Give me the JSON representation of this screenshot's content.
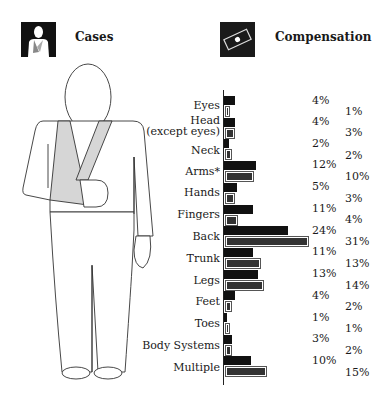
{
  "header": {
    "cases_title": "Cases",
    "compensation_title": "Compensation",
    "cases_icon": "injured-person-icon",
    "compensation_icon": "money-bill-icon"
  },
  "chart_data": {
    "type": "bar",
    "orientation": "horizontal",
    "categories": [
      "Eyes",
      "Head (except eyes)",
      "Neck",
      "Arms*",
      "Hands",
      "Fingers",
      "Back",
      "Trunk",
      "Legs",
      "Feet",
      "Toes",
      "Body Systems",
      "Multiple"
    ],
    "series": [
      {
        "name": "Cases",
        "color": "#111111",
        "values": [
          4,
          4,
          2,
          12,
          5,
          11,
          24,
          11,
          13,
          4,
          1,
          3,
          10
        ]
      },
      {
        "name": "Compensation",
        "color": "#333333",
        "values": [
          1,
          3,
          2,
          10,
          3,
          4,
          31,
          13,
          14,
          2,
          1,
          2,
          15
        ]
      }
    ],
    "value_suffix": "%",
    "grid": false,
    "legend": "icons at top: Cases (left), Compensation (right)"
  },
  "rows": [
    {
      "label": "Eyes",
      "label2": "",
      "cases": "4%",
      "comp": "1%"
    },
    {
      "label": "Head",
      "label2": "(except eyes)",
      "cases": "4%",
      "comp": "3%"
    },
    {
      "label": "Neck",
      "label2": "",
      "cases": "2%",
      "comp": "2%"
    },
    {
      "label": "Arms*",
      "label2": "",
      "cases": "12%",
      "comp": "10%"
    },
    {
      "label": "Hands",
      "label2": "",
      "cases": "5%",
      "comp": "3%"
    },
    {
      "label": "Fingers",
      "label2": "",
      "cases": "11%",
      "comp": "4%"
    },
    {
      "label": "Back",
      "label2": "",
      "cases": "24%",
      "comp": "31%"
    },
    {
      "label": "Trunk",
      "label2": "",
      "cases": "11%",
      "comp": "13%"
    },
    {
      "label": "Legs",
      "label2": "",
      "cases": "13%",
      "comp": "14%"
    },
    {
      "label": "Feet",
      "label2": "",
      "cases": "4%",
      "comp": "2%"
    },
    {
      "label": "Toes",
      "label2": "",
      "cases": "1%",
      "comp": "1%"
    },
    {
      "label": "Body Systems",
      "label2": "",
      "cases": "3%",
      "comp": "2%"
    },
    {
      "label": "Multiple",
      "label2": "",
      "cases": "10%",
      "comp": "15%"
    }
  ]
}
